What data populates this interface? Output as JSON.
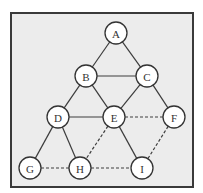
{
  "diagram": {
    "type": "graph",
    "frame": {
      "x": 11,
      "y": 13,
      "width": 182,
      "height": 174,
      "background": "#ececec",
      "border": "#3a3a3a"
    },
    "node_radius": 11,
    "nodes": [
      {
        "id": "A",
        "label": "A",
        "x": 116,
        "y": 33
      },
      {
        "id": "B",
        "label": "B",
        "x": 86,
        "y": 76
      },
      {
        "id": "C",
        "label": "C",
        "x": 147,
        "y": 76
      },
      {
        "id": "D",
        "label": "D",
        "x": 58,
        "y": 117
      },
      {
        "id": "E",
        "label": "E",
        "x": 114,
        "y": 117
      },
      {
        "id": "F",
        "label": "F",
        "x": 174,
        "y": 117
      },
      {
        "id": "G",
        "label": "G",
        "x": 30,
        "y": 168
      },
      {
        "id": "H",
        "label": "H",
        "x": 80,
        "y": 168
      },
      {
        "id": "I",
        "label": "I",
        "x": 142,
        "y": 168
      }
    ],
    "edges": [
      {
        "from": "A",
        "to": "B",
        "style": "solid"
      },
      {
        "from": "A",
        "to": "C",
        "style": "solid"
      },
      {
        "from": "B",
        "to": "C",
        "style": "solid"
      },
      {
        "from": "B",
        "to": "D",
        "style": "solid"
      },
      {
        "from": "B",
        "to": "E",
        "style": "solid"
      },
      {
        "from": "C",
        "to": "E",
        "style": "solid"
      },
      {
        "from": "C",
        "to": "F",
        "style": "solid"
      },
      {
        "from": "D",
        "to": "E",
        "style": "solid"
      },
      {
        "from": "D",
        "to": "G",
        "style": "solid"
      },
      {
        "from": "D",
        "to": "H",
        "style": "solid"
      },
      {
        "from": "E",
        "to": "I",
        "style": "solid"
      },
      {
        "from": "E",
        "to": "F",
        "style": "dashed"
      },
      {
        "from": "E",
        "to": "H",
        "style": "dashed"
      },
      {
        "from": "F",
        "to": "I",
        "style": "dashed"
      },
      {
        "from": "G",
        "to": "H",
        "style": "dashed"
      },
      {
        "from": "H",
        "to": "I",
        "style": "dashed"
      }
    ]
  }
}
